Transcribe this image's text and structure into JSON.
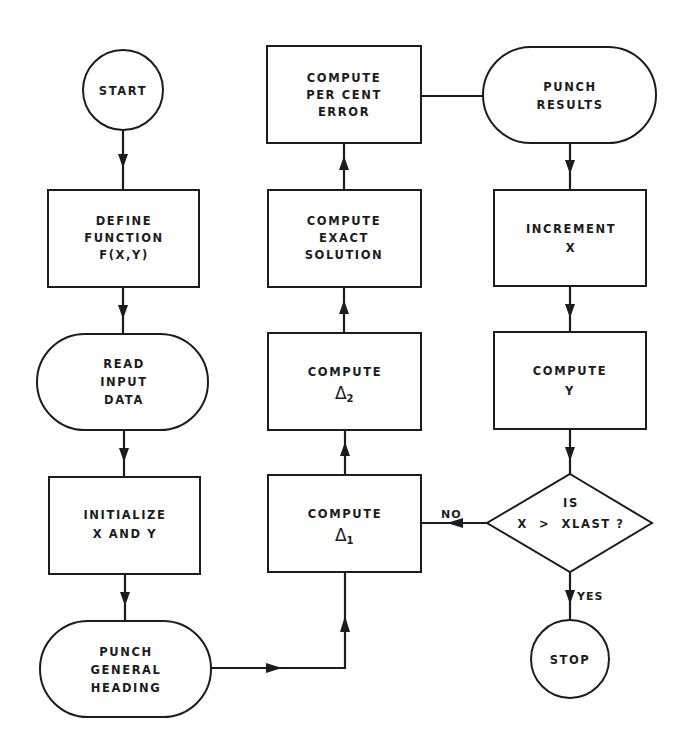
{
  "diagram": {
    "type": "flowchart",
    "colors": {
      "line": "#1c1c1c",
      "background": "#ffffff"
    },
    "nodes": {
      "start": {
        "shape": "circle",
        "lines": [
          "START"
        ]
      },
      "define_function": {
        "shape": "rectangle",
        "lines": [
          "DEFINE",
          "FUNCTION",
          "F(X,Y)"
        ]
      },
      "read_input": {
        "shape": "terminal",
        "lines": [
          "READ",
          "INPUT",
          "DATA"
        ]
      },
      "initialize": {
        "shape": "rectangle",
        "lines": [
          "INITIALIZE",
          "X AND Y"
        ]
      },
      "punch_heading": {
        "shape": "terminal",
        "lines": [
          "PUNCH",
          "GENERAL",
          "HEADING"
        ]
      },
      "compute_delta1": {
        "shape": "rectangle",
        "lines": [
          "COMPUTE"
        ],
        "symbol": "Δ",
        "subscript": "1"
      },
      "compute_delta2": {
        "shape": "rectangle",
        "lines": [
          "COMPUTE"
        ],
        "symbol": "Δ",
        "subscript": "2"
      },
      "compute_exact": {
        "shape": "rectangle",
        "lines": [
          "COMPUTE",
          "EXACT",
          "SOLUTION"
        ]
      },
      "compute_error": {
        "shape": "rectangle",
        "lines": [
          "COMPUTE",
          "PER CENT",
          "ERROR"
        ]
      },
      "punch_results": {
        "shape": "terminal",
        "lines": [
          "PUNCH",
          "RESULTS"
        ]
      },
      "increment_x": {
        "shape": "rectangle",
        "lines": [
          "INCREMENT",
          "X"
        ]
      },
      "compute_y": {
        "shape": "rectangle",
        "lines": [
          "COMPUTE",
          "Y"
        ]
      },
      "decision": {
        "shape": "diamond",
        "lines": [
          "IS",
          "X  >  XLAST ?"
        ]
      },
      "stop": {
        "shape": "circle",
        "lines": [
          "STOP"
        ]
      }
    },
    "edges": [
      {
        "from": "start",
        "to": "define_function"
      },
      {
        "from": "define_function",
        "to": "read_input"
      },
      {
        "from": "read_input",
        "to": "initialize"
      },
      {
        "from": "initialize",
        "to": "punch_heading"
      },
      {
        "from": "punch_heading",
        "to": "compute_delta1"
      },
      {
        "from": "compute_delta1",
        "to": "compute_delta2"
      },
      {
        "from": "compute_delta2",
        "to": "compute_exact"
      },
      {
        "from": "compute_exact",
        "to": "compute_error"
      },
      {
        "from": "compute_error",
        "to": "punch_results"
      },
      {
        "from": "punch_results",
        "to": "increment_x"
      },
      {
        "from": "increment_x",
        "to": "compute_y"
      },
      {
        "from": "compute_y",
        "to": "decision"
      },
      {
        "from": "decision",
        "to": "compute_delta1",
        "label": "NO"
      },
      {
        "from": "decision",
        "to": "stop",
        "label": "YES"
      }
    ],
    "edge_labels": {
      "no": "NO",
      "yes": "YES"
    }
  }
}
